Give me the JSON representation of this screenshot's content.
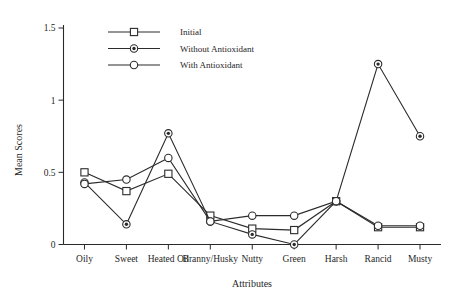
{
  "chart_data": {
    "type": "line",
    "title": "",
    "xlabel": "Attributes",
    "ylabel": "Mean Scores",
    "categories": [
      "Oily",
      "Sweet",
      "Heated Oil",
      "Branny/Husky",
      "Nutty",
      "Green",
      "Harsh",
      "Rancid",
      "Musty"
    ],
    "ylim": [
      0,
      1.5
    ],
    "ytick_labels": [
      "0",
      "0.5",
      "1",
      "1.5"
    ],
    "ytick_values": [
      0,
      0.5,
      1,
      1.5
    ],
    "grid": false,
    "legend_position": "top-center",
    "series": [
      {
        "name": "Initial",
        "marker": "square-open",
        "values": [
          0.5,
          0.37,
          0.49,
          0.2,
          0.11,
          0.1,
          0.3,
          0.12,
          0.12
        ]
      },
      {
        "name": "Without Antioxidant",
        "marker": "circle-filled",
        "values": [
          0.43,
          0.14,
          0.77,
          0.16,
          0.07,
          0.0,
          0.3,
          1.25,
          0.75
        ]
      },
      {
        "name": "With Antioxidant",
        "marker": "circle-open",
        "values": [
          0.42,
          0.45,
          0.6,
          0.16,
          0.2,
          0.2,
          0.3,
          0.13,
          0.13
        ]
      }
    ]
  },
  "legend": {
    "entries": [
      {
        "label": "Initial"
      },
      {
        "label": "Without Antioxidant"
      },
      {
        "label": "With Antioxidant"
      }
    ]
  },
  "axes": {
    "x_title": "Attributes",
    "y_title": "Mean Scores"
  },
  "colors": {
    "ink": "#2b2b2b",
    "background": "#ffffff"
  }
}
